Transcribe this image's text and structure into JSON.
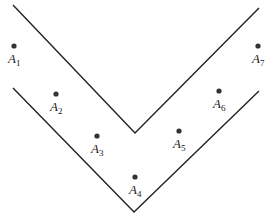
{
  "diagram": {
    "colors": {
      "line": "#222222",
      "point": "#333333",
      "background": "#ffffff"
    },
    "boundaries": [
      {
        "name": "upper-v-boundary",
        "points": [
          [
            13,
            5
          ],
          [
            135,
            133
          ],
          [
            259,
            8
          ]
        ]
      },
      {
        "name": "lower-v-boundary",
        "points": [
          [
            13,
            88
          ],
          [
            134,
            212
          ],
          [
            259,
            91
          ]
        ]
      }
    ],
    "points": [
      {
        "id": "A1",
        "letter": "A",
        "sub": "1",
        "x": 14,
        "y": 46
      },
      {
        "id": "A2",
        "letter": "A",
        "sub": "2",
        "x": 56,
        "y": 94
      },
      {
        "id": "A3",
        "letter": "A",
        "sub": "3",
        "x": 97,
        "y": 136
      },
      {
        "id": "A4",
        "letter": "A",
        "sub": "4",
        "x": 135,
        "y": 177
      },
      {
        "id": "A5",
        "letter": "A",
        "sub": "5",
        "x": 179,
        "y": 131
      },
      {
        "id": "A6",
        "letter": "A",
        "sub": "6",
        "x": 219,
        "y": 91
      },
      {
        "id": "A7",
        "letter": "A",
        "sub": "7",
        "x": 258,
        "y": 46
      }
    ]
  }
}
